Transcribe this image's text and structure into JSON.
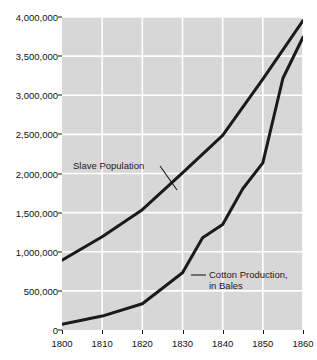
{
  "chart_data": {
    "type": "line",
    "title": "",
    "xlabel": "",
    "ylabel": "",
    "xlim": [
      1800,
      1860
    ],
    "ylim": [
      0,
      4000000
    ],
    "grid": true,
    "legend_position": "inline-annotations",
    "x_ticks": [
      "1800",
      "1810",
      "1820",
      "1830",
      "1840",
      "1850",
      "1860"
    ],
    "y_ticks": [
      "0",
      "500,000",
      "1,000,000",
      "1,500,000",
      "2,000,000",
      "2,500,000",
      "3,000,000",
      "3,500,000",
      "4,000,000"
    ],
    "series": [
      {
        "name": "Slave Population",
        "x": [
          1800,
          1810,
          1820,
          1830,
          1840,
          1850,
          1860
        ],
        "values": [
          893000,
          1191000,
          1538000,
          2009000,
          2487000,
          3205000,
          3954000
        ]
      },
      {
        "name": "Cotton Production, in Bales",
        "x": [
          1800,
          1810,
          1820,
          1825,
          1830,
          1835,
          1840,
          1845,
          1850,
          1855,
          1860
        ],
        "values": [
          73000,
          178000,
          335000,
          533000,
          732000,
          1180000,
          1348000,
          1805000,
          2136000,
          3217000,
          3741000
        ]
      }
    ],
    "annotations": [
      {
        "text": "Slave Population",
        "target_series": "Slave Population"
      },
      {
        "text_line1": "Cotton Production,",
        "text_line2": "in Bales",
        "target_series": "Cotton Production, in Bales"
      }
    ],
    "colors": {
      "plot_background": "#d7d7d7",
      "gridline": "#ffffff",
      "series_line": "#1a1a1a",
      "axis_text": "#111111"
    }
  }
}
